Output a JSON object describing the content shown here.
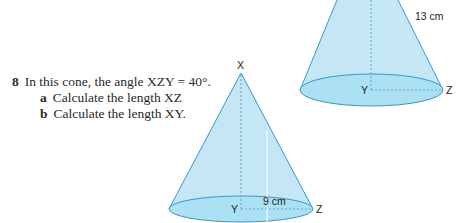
{
  "question": {
    "number": "8",
    "stem": "In this cone, the angle XZY = 40°.",
    "parts": [
      {
        "letter": "a",
        "text": "Calculate the length XZ"
      },
      {
        "letter": "b",
        "text": "Calculate the length XY."
      }
    ]
  },
  "back_cone": {
    "slant_label": "13 cm",
    "center_label": "Y",
    "edge_label": "Z"
  },
  "front_cone": {
    "apex_label": "X",
    "center_label": "Y",
    "edge_label": "Z",
    "radius_label": "9 cm"
  },
  "colors": {
    "cone_fill": "#bfe3f3",
    "cone_base": "#a8d8ee",
    "cone_stroke": "#3a97c9"
  }
}
